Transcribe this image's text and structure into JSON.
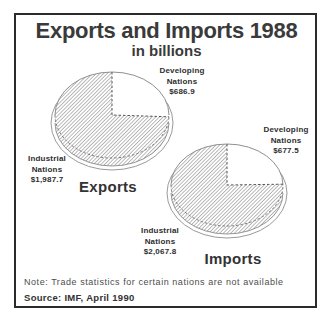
{
  "title": "Exports and Imports 1988",
  "subtitle": "in billions",
  "note": "Note: Trade statistics for certain nations are not available",
  "source": "Source: IMF, April 1990",
  "exports": {
    "caption": "Exports",
    "developing_label": "Developing\nNations\n$686.9",
    "industrial_label": "Industrial\nNations\n$1,987.7"
  },
  "imports": {
    "caption": "Imports",
    "developing_label": "Developing\nNations\n$677.5",
    "industrial_label": "Industrial\nNations\n$2,067.8"
  },
  "chart_data": [
    {
      "type": "pie",
      "title": "Exports",
      "units": "billions of dollars",
      "slices": [
        {
          "label": "Developing Nations",
          "value": 686.9,
          "fill": "white"
        },
        {
          "label": "Industrial Nations",
          "value": 1987.7,
          "fill": "gray-hatch"
        }
      ],
      "start": "12 o'clock, clockwise",
      "style": "3d-ellipse"
    },
    {
      "type": "pie",
      "title": "Imports",
      "units": "billions of dollars",
      "slices": [
        {
          "label": "Developing Nations",
          "value": 677.5,
          "fill": "white"
        },
        {
          "label": "Industrial Nations",
          "value": 2067.8,
          "fill": "gray-hatch"
        }
      ],
      "start": "12 o'clock, clockwise",
      "style": "3d-ellipse"
    }
  ],
  "colors": {
    "frame_border": "#2b2b2b",
    "text": "#3a3a3a",
    "hatch_line": "#7d7d7d",
    "background": "#ffffff"
  }
}
